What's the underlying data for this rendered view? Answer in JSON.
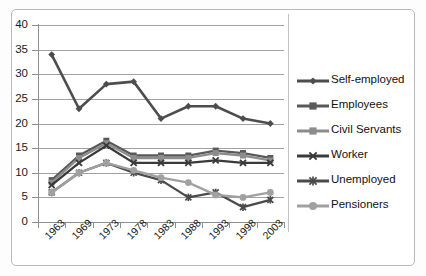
{
  "chart_data": {
    "type": "line",
    "title": "",
    "xlabel": "",
    "ylabel": "",
    "ylim": [
      0,
      40
    ],
    "ytick_step": 5,
    "yticks": [
      "0",
      "5",
      "10",
      "15",
      "20",
      "25",
      "30",
      "35",
      "40"
    ],
    "grid": true,
    "legend_position": "right",
    "categories": [
      "1963",
      "1969",
      "1973",
      "1978",
      "1983",
      "1988",
      "1993",
      "1998",
      "2003"
    ],
    "series": [
      {
        "name": "Self-employed",
        "marker": "diamond",
        "color": "#4d4d4d",
        "values": [
          34,
          23,
          28,
          28.5,
          21,
          23.5,
          23.5,
          21,
          20
        ]
      },
      {
        "name": "Employees",
        "marker": "square",
        "color": "#595959",
        "values": [
          8.5,
          13.5,
          16.5,
          13.5,
          13.5,
          13.5,
          14.5,
          14,
          13
        ]
      },
      {
        "name": "Civil Servants",
        "marker": "square",
        "color": "#8c8c8c",
        "values": [
          8,
          13,
          16,
          13,
          13,
          13,
          14,
          13.5,
          12.5
        ]
      },
      {
        "name": "Worker",
        "marker": "x",
        "color": "#3a3a3a",
        "values": [
          7.5,
          12,
          15.5,
          12,
          12,
          12,
          12.5,
          12,
          12
        ]
      },
      {
        "name": "Unemployed",
        "marker": "cross",
        "color": "#4a4a4a",
        "values": [
          6,
          10,
          12,
          10,
          8.5,
          5,
          6,
          3,
          4.5
        ]
      },
      {
        "name": "Pensioners",
        "marker": "circle",
        "color": "#a0a0a0",
        "values": [
          6,
          10,
          12,
          10.5,
          9,
          8,
          5.5,
          5,
          6
        ]
      }
    ]
  }
}
